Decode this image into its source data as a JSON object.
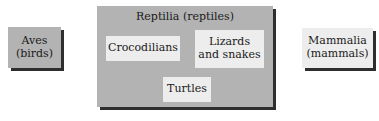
{
  "diagram": {
    "type": "classification-boxes",
    "colors": {
      "gray_box": "#b3b3b3",
      "light_box": "#ededed",
      "shadow": "#2e2e2e"
    },
    "groups": [
      {
        "id": "aves",
        "line1": "Aves",
        "line2": "(birds)"
      },
      {
        "id": "reptilia",
        "title": "Reptilia (reptiles)",
        "members": [
          {
            "id": "crocodilians",
            "line1": "Crocodilians"
          },
          {
            "id": "lizards-snakes",
            "line1": "Lizards",
            "line2": "and snakes"
          },
          {
            "id": "turtles",
            "line1": "Turtles"
          }
        ]
      },
      {
        "id": "mammalia",
        "line1": "Mammalia",
        "line2": "(mammals)"
      }
    ]
  }
}
